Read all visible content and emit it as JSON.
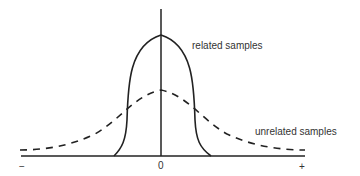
{
  "diagram": {
    "type": "distribution-comparison",
    "curves": [
      {
        "name": "related samples",
        "style": "solid",
        "shape": "narrow tall bell / plateau"
      },
      {
        "name": "unrelated samples",
        "style": "dashed",
        "shape": "wide low bell"
      }
    ],
    "labels": {
      "related": "related samples",
      "unrelated": "unrelated samples"
    },
    "x_axis": {
      "ticks": [
        "−",
        "0",
        "+"
      ]
    },
    "colors": {
      "line": "#222222",
      "text": "#333333",
      "background": "#ffffff"
    }
  }
}
